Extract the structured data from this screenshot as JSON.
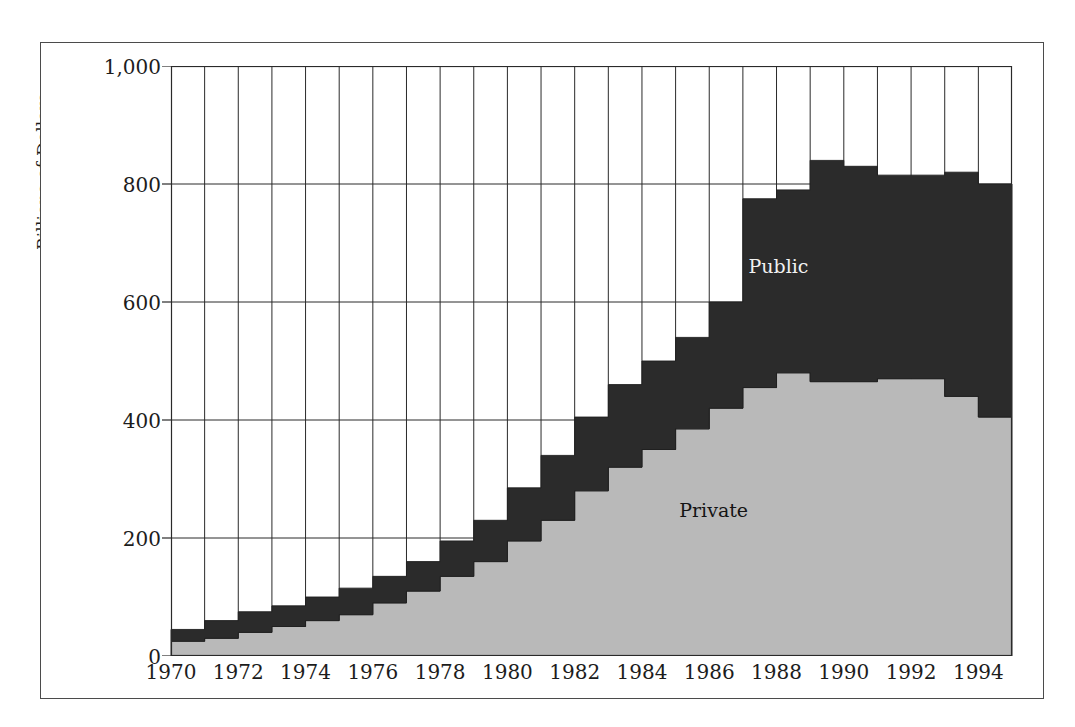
{
  "figure": {
    "y_axis_title": "Billions of Dollars"
  },
  "chart_data": {
    "type": "area",
    "title": "",
    "subtitle": "",
    "xlabel": "",
    "ylabel": "Billions of Dollars",
    "xlim": [
      1970,
      1995
    ],
    "ylim": [
      0,
      1000
    ],
    "yticks": [
      0,
      200,
      400,
      600,
      800,
      1000
    ],
    "ytick_labels": [
      "0",
      "200",
      "400",
      "600",
      "800",
      "1,000"
    ],
    "xticks": [
      1970,
      1972,
      1974,
      1976,
      1978,
      1980,
      1982,
      1984,
      1986,
      1988,
      1990,
      1992,
      1994
    ],
    "xtick_labels": [
      "1970",
      "1972",
      "1974",
      "1976",
      "1978",
      "1980",
      "1982",
      "1984",
      "1986",
      "1988",
      "1990",
      "1992",
      "1994"
    ],
    "grid": "both",
    "step": "post",
    "stacked": true,
    "legend_position": "inline-annotation",
    "x": [
      1970,
      1971,
      1972,
      1973,
      1974,
      1975,
      1976,
      1977,
      1978,
      1979,
      1980,
      1981,
      1982,
      1983,
      1984,
      1985,
      1986,
      1987,
      1988,
      1989,
      1990,
      1991,
      1992,
      1993,
      1994
    ],
    "series": [
      {
        "name": "Private",
        "color": "#b9b9b9",
        "values": [
          25,
          30,
          40,
          50,
          60,
          70,
          90,
          110,
          135,
          160,
          195,
          230,
          280,
          320,
          350,
          385,
          420,
          455,
          480,
          465,
          465,
          470,
          470,
          440,
          405
        ]
      },
      {
        "name": "Public",
        "color": "#2b2b2b",
        "values": [
          20,
          30,
          35,
          35,
          40,
          45,
          45,
          50,
          60,
          70,
          90,
          110,
          125,
          140,
          150,
          155,
          180,
          320,
          310,
          375,
          365,
          345,
          345,
          380,
          395
        ]
      }
    ],
    "totals": [
      45,
      60,
      75,
      85,
      100,
      115,
      135,
      160,
      195,
      230,
      285,
      340,
      405,
      460,
      500,
      540,
      600,
      775,
      790,
      840,
      830,
      815,
      815,
      820,
      800
    ],
    "annotations": [
      {
        "text": "Public",
        "x": 1988,
        "y": 660,
        "color": "#f2f2f2"
      },
      {
        "text": "Private",
        "x": 1986,
        "y": 245,
        "color": "#141414"
      }
    ]
  }
}
